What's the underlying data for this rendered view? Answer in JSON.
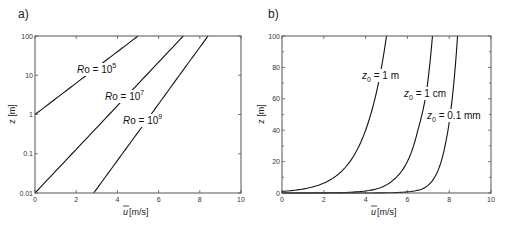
{
  "chart_data": [
    {
      "type": "line",
      "panel": "a)",
      "title": "",
      "xlabel": "ū[m/s]",
      "ylabel": "z [m]",
      "xlim": [
        0,
        10
      ],
      "ylim": [
        0.01,
        100
      ],
      "yscale": "log",
      "xticks": [
        "0",
        "2",
        "4",
        "6",
        "8",
        "10"
      ],
      "yticks": [
        "0.01",
        "0.1",
        "1",
        "10",
        "100"
      ],
      "grid": false,
      "series": [
        {
          "name": "Ro = 10^5",
          "label_main": "Ro = 10",
          "label_exp": "5",
          "x": [
            0,
            1.25,
            2.5,
            3.75,
            5.0
          ],
          "y": [
            1,
            3.16,
            10,
            31.6,
            100
          ]
        },
        {
          "name": "Ro = 10^7",
          "label_main": "Ro = 10",
          "label_exp": "7",
          "x": [
            0,
            1.8,
            3.6,
            5.4,
            7.2
          ],
          "y": [
            0.01,
            0.1,
            1,
            10,
            100
          ]
        },
        {
          "name": "Ro = 10^9",
          "label_main": "Ro = 10",
          "label_exp": "9",
          "x": [
            2.85,
            4.24,
            5.63,
            7.01,
            8.4
          ],
          "y": [
            0.01,
            0.1,
            1,
            10,
            100
          ]
        }
      ]
    },
    {
      "type": "line",
      "panel": "b)",
      "title": "",
      "xlabel": "ū[m/s]",
      "ylabel": "z [m]",
      "xlim": [
        0,
        10
      ],
      "ylim": [
        0,
        100
      ],
      "yscale": "linear",
      "xticks": [
        "0",
        "2",
        "4",
        "6",
        "8",
        "10"
      ],
      "yticks": [
        "0",
        "20",
        "40",
        "60",
        "80",
        "100"
      ],
      "grid": false,
      "series": [
        {
          "name": "z0 = 1 m",
          "label_sub": "0",
          "label_rest": " = 1 m",
          "x": [
            0,
            0.75,
            1.75,
            2.5,
            3.25,
            4.0,
            4.5,
            5.0
          ],
          "y": [
            1,
            2,
            5,
            10,
            20,
            40,
            63,
            100
          ]
        },
        {
          "name": "z0 = 1 cm",
          "label_sub": "0",
          "label_rest": " = 1 cm",
          "x": [
            2.2,
            3.3,
            4.5,
            5.3,
            6.0,
            6.5,
            6.9,
            7.2
          ],
          "y": [
            0.1,
            0.5,
            2.5,
            8,
            20,
            40,
            63,
            100
          ]
        },
        {
          "name": "z0 = 0.1 mm",
          "label_sub": "0",
          "label_rest": " = 0.1 mm",
          "x": [
            2.8,
            4.5,
            5.8,
            6.7,
            7.3,
            7.8,
            8.1,
            8.4
          ],
          "y": [
            0.01,
            0.05,
            0.5,
            2.5,
            10,
            30,
            55,
            100
          ]
        }
      ]
    }
  ],
  "panels": {
    "a": {
      "label": "a)",
      "ylabel": "z [m]",
      "xlabel_bar": "u",
      "xlabel_rest": "[m/s]"
    },
    "b": {
      "label": "b)",
      "ylabel": "z [m]",
      "xlabel_bar": "u",
      "xlabel_rest": "[m/s]"
    }
  }
}
